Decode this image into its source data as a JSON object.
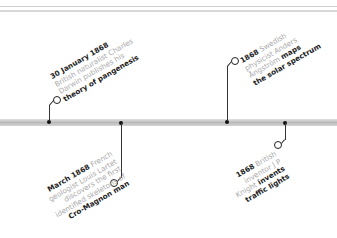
{
  "timeline": {
    "events": [
      {
        "id": "pangenesis",
        "lines": [
          {
            "date": "30 January 1868",
            "text": ""
          },
          {
            "text": "British naturalist Charles"
          },
          {
            "text": "Darwin publishes his"
          },
          {
            "bold": "theory of pangenesis"
          }
        ]
      },
      {
        "id": "cro-magnon",
        "lines": [
          {
            "date": "March 1868",
            "text": " French"
          },
          {
            "text": "geologist Louis Lartet"
          },
          {
            "text": "discovers the first"
          },
          {
            "text": "identified skeletons of"
          },
          {
            "bold": "Cro-Magnon man"
          }
        ]
      },
      {
        "id": "solar-spectrum",
        "lines": [
          {
            "date": "1868",
            "text": " Swedish"
          },
          {
            "text": "physicist Anders"
          },
          {
            "text": "Ångström ",
            "bold": "maps"
          },
          {
            "bold": "the solar spectrum"
          }
        ]
      },
      {
        "id": "traffic-lights",
        "lines": [
          {
            "date": "1868",
            "text": " British"
          },
          {
            "text": "inventor J P"
          },
          {
            "text": "Knight ",
            "bold": "invents"
          },
          {
            "bold": "traffic lights"
          }
        ]
      }
    ]
  }
}
